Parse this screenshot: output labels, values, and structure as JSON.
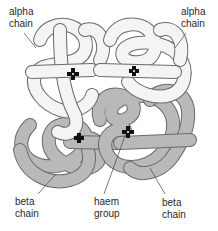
{
  "diagram": {
    "colors": {
      "alpha_fill": "#f4f4f4",
      "beta_fill": "#b9b9b9",
      "outline": "#6a6a6a",
      "haem": "#111111",
      "text": "#2a2a2a"
    },
    "labels": [
      {
        "id": "alpha-left",
        "line1": "alpha",
        "line2": "chain"
      },
      {
        "id": "alpha-right",
        "line1": "alpha",
        "line2": "chain"
      },
      {
        "id": "beta-left",
        "line1": "beta",
        "line2": "chain"
      },
      {
        "id": "haem",
        "line1": "haem",
        "line2": "group"
      },
      {
        "id": "beta-right",
        "line1": "beta",
        "line2": "chain"
      }
    ]
  }
}
